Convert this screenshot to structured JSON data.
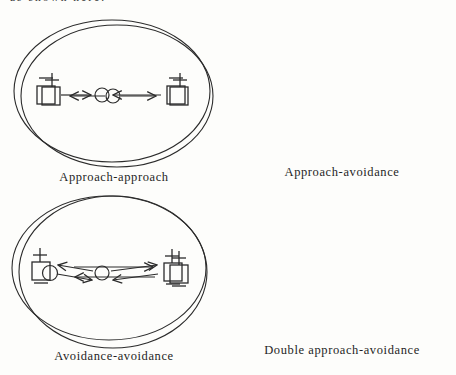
{
  "page": {
    "background": "#fdfdfb",
    "ink_color": "#2b2b2b",
    "top_text_fragment": "as shown here."
  },
  "figure": {
    "panels": [
      {
        "caption": "Approach-approach",
        "left_goal_valence": "+",
        "right_goal_valence": "+",
        "person": "circle",
        "arrow_pattern": "arrows from person point outward toward both goals"
      },
      {
        "caption": "Approach-avoidance",
        "left_goal_valence": "−",
        "right_goal_valence": "−",
        "person": "circle",
        "arrow_pattern": "arrows from both goals point inward toward person"
      },
      {
        "caption": "Avoidance-avoidance",
        "right_goal_valence": "+/−",
        "person": "circle",
        "arrow_pattern": "two long parallel horizontal arrows, top toward goal, bottom away from goal"
      },
      {
        "caption": "Double approach-avoidance",
        "left_goal_valence": "+/−",
        "right_goal_valence": "+/−",
        "person": "circle",
        "arrow_pattern": "paired toward/away slanted arrows on both sides of person"
      }
    ]
  }
}
